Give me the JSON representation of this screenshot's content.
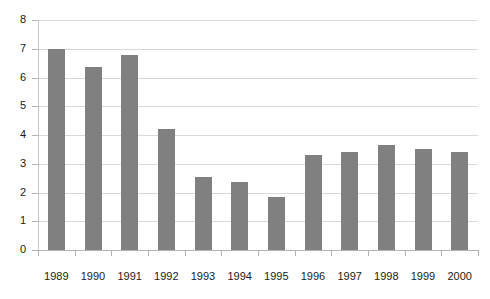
{
  "chart_data": {
    "type": "bar",
    "title": "",
    "subtitle": "",
    "xlabel": "",
    "ylabel": "",
    "categories": [
      "1989",
      "1990",
      "1991",
      "1992",
      "1993",
      "1994",
      "1995",
      "1996",
      "1997",
      "1998",
      "1999",
      "2000"
    ],
    "values": [
      7.0,
      6.35,
      6.8,
      4.2,
      2.55,
      2.35,
      1.85,
      3.3,
      3.4,
      3.65,
      3.5,
      3.4
    ],
    "series": [
      {
        "name": "",
        "values": [
          7.0,
          6.35,
          6.8,
          4.2,
          2.55,
          2.35,
          1.85,
          3.3,
          3.4,
          3.65,
          3.5,
          3.4
        ]
      }
    ],
    "ylim": [
      0,
      8
    ],
    "yticks": [
      0,
      1,
      2,
      3,
      4,
      5,
      6,
      7,
      8
    ],
    "ytick_labels": [
      "0",
      "1",
      "2",
      "3",
      "4",
      "5",
      "6",
      "7",
      "8"
    ],
    "grid": true,
    "grid_axis": "y",
    "legend": false,
    "legend_position": "none",
    "annotations": [],
    "colors": {
      "bar": "#808080",
      "gridline": "#d9d9d9",
      "axis": "#b3b3b3",
      "text": "#1a1a1a",
      "background": "#ffffff"
    }
  }
}
